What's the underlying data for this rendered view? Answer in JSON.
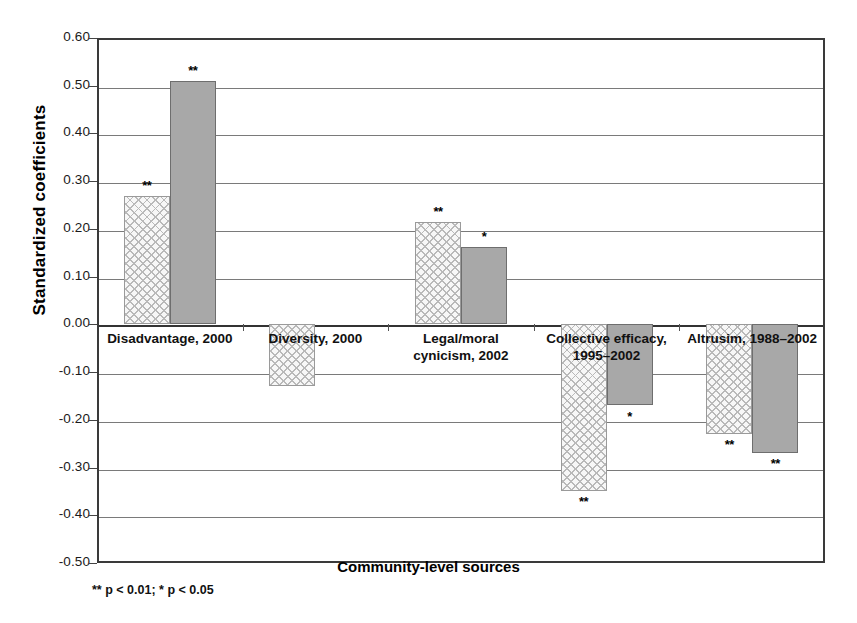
{
  "chart_data": {
    "type": "bar",
    "title": "",
    "xlabel": "Community-level sources",
    "ylabel": "Standardized coefficients",
    "ylim": [
      -0.5,
      0.6
    ],
    "ytick_labels": [
      "0.60",
      "0.50",
      "0.40",
      "0.30",
      "0.20",
      "0.10",
      "0.00",
      "-0.10",
      "-0.20",
      "-0.30",
      "-0.40",
      "-0.50"
    ],
    "ytick_values": [
      0.6,
      0.5,
      0.4,
      0.3,
      0.2,
      0.1,
      0.0,
      -0.1,
      -0.2,
      -0.3,
      -0.4,
      -0.5
    ],
    "grid": true,
    "legend_position": "top-center",
    "categories": [
      "Disadvantage, 2000",
      "Diversity, 2000",
      "Legal/moral cynicism, 2002",
      "Collective efficacy, 1995–2002",
      "Altrusim, 1988–2002"
    ],
    "category_lines": [
      [
        "Disadvantage, 2000"
      ],
      [
        "Diversity, 2000"
      ],
      [
        "Legal/moral",
        "cynicism, 2002"
      ],
      [
        "Collective efficacy,",
        "1995–2002"
      ],
      [
        "Altrusim, 1988–2002"
      ]
    ],
    "series": [
      {
        "name": "Homicide rate, 2002-6",
        "key": "homicide",
        "values": [
          0.27,
          -0.13,
          0.215,
          -0.35,
          -0.23
        ],
        "significance": [
          "**",
          "",
          "**",
          "**",
          "**"
        ]
      },
      {
        "name": "Teen birth rate, 2003-5",
        "key": "teen",
        "values": [
          0.51,
          null,
          0.163,
          -0.17,
          -0.27
        ],
        "significance": [
          "**",
          "",
          "*",
          "*",
          "**"
        ]
      }
    ],
    "footnote": "** p < 0.01; * p < 0.05"
  },
  "legend": {
    "items": [
      {
        "label": "Homicide rate, 2002-6",
        "swatch": "hatched-square-icon"
      },
      {
        "label": "Teen birth rate, 2003-5",
        "swatch": "gray-square-icon"
      }
    ]
  }
}
